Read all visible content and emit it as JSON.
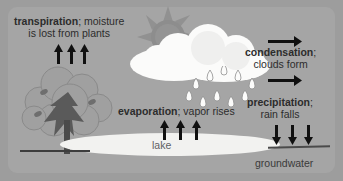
{
  "diagram": {
    "background_color": "#9d9d9d",
    "panel_color": "#a5a5a5"
  },
  "labels": {
    "transpiration": {
      "term": "transpiration",
      "rest": "; moisture",
      "line2": "is lost from plants"
    },
    "condensation": {
      "term": "condensation",
      "rest": ";",
      "line2": "clouds form"
    },
    "precipitation": {
      "term": "precipitation",
      "rest": ";",
      "line2": "rain falls"
    },
    "evaporation": {
      "term": "evaporation",
      "rest": "; vapor rises"
    },
    "lake": "lake",
    "groundwater": "groundwater"
  },
  "elements": {
    "sun": "sun-icon",
    "cloud": "cloud-icon",
    "rain": "raindrops-icon",
    "tree": "tree-icon",
    "lake_body": "lake-water",
    "ground_line_left": "ground-line",
    "ground_line_right": "ground-line"
  },
  "arrows": {
    "transpiration_up": [
      "arrow-up",
      "arrow-up",
      "arrow-up"
    ],
    "evaporation_up": [
      "arrow-up",
      "arrow-up",
      "arrow-up"
    ],
    "precipitation_down": [
      "arrow-down",
      "arrow-down",
      "arrow-down"
    ],
    "condensation_right": [
      "arrow-right",
      "arrow-right"
    ]
  },
  "colors": {
    "arrow": "#101010",
    "text": "#2c2c2c",
    "lake": "#f2f2f0",
    "cloud": "#fbfbfa",
    "sun": "#8f8f8f",
    "tree_canopy": "#9a9a9a",
    "tree_trunk": "#4a4a4a"
  }
}
